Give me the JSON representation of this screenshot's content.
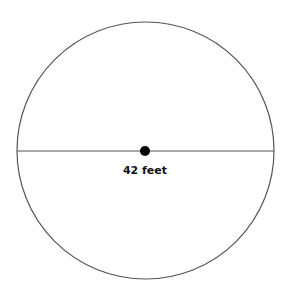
{
  "diagram": {
    "type": "circle-with-diameter",
    "diameter_label": "42 feet",
    "colors": {
      "circle_stroke": "#555555",
      "line_stroke": "#555555",
      "center_dot": "#000000",
      "background": "#ffffff"
    }
  }
}
